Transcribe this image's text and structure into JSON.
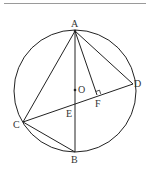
{
  "diagram": {
    "type": "circle-geometry",
    "circle": {
      "center_label": "O",
      "cx": 75,
      "cy": 91,
      "r": 61
    },
    "points": {
      "A": {
        "label": "A",
        "x": 75,
        "y": 31
      },
      "B": {
        "label": "B",
        "x": 75,
        "y": 152
      },
      "C": {
        "label": "C",
        "x": 23,
        "y": 122
      },
      "D": {
        "label": "D",
        "x": 133,
        "y": 84
      },
      "O": {
        "label": "O",
        "x": 75,
        "y": 90
      },
      "E": {
        "label": "E",
        "x": 75,
        "y": 104
      },
      "F": {
        "label": "F",
        "x": 97,
        "y": 95
      }
    },
    "segments": [
      "AB",
      "AC",
      "AD",
      "AF",
      "CD",
      "CB"
    ],
    "annotations": [
      "right angle at F (AF ⊥ CD)"
    ]
  },
  "colors": {
    "stroke": "#222222",
    "topline": "#9a9a9a"
  }
}
